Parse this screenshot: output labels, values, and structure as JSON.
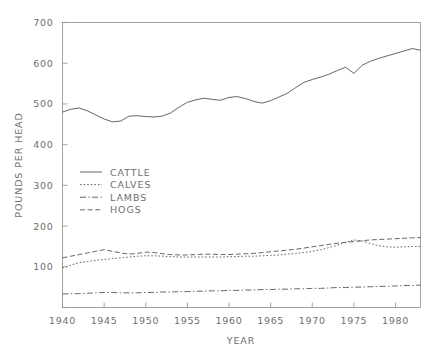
{
  "chart_data": {
    "type": "line",
    "title": "",
    "xlabel": "YEAR",
    "ylabel": "POUNDS PER HEAD",
    "xlim": [
      1940,
      1983
    ],
    "ylim": [
      0,
      700
    ],
    "xticks": [
      1940,
      1945,
      1950,
      1955,
      1960,
      1965,
      1970,
      1975,
      1980
    ],
    "yticks": [
      0,
      100,
      200,
      300,
      400,
      500,
      600,
      700
    ],
    "ytick_labels": [
      "",
      "100",
      "200",
      "300",
      "400",
      "500",
      "600",
      "700"
    ],
    "grid": false,
    "legend_position": "center-left inside axes",
    "x": [
      1940,
      1941,
      1942,
      1943,
      1944,
      1945,
      1946,
      1947,
      1948,
      1949,
      1950,
      1951,
      1952,
      1953,
      1954,
      1955,
      1956,
      1957,
      1958,
      1959,
      1960,
      1961,
      1962,
      1963,
      1964,
      1965,
      1966,
      1967,
      1968,
      1969,
      1970,
      1971,
      1972,
      1973,
      1974,
      1975,
      1976,
      1977,
      1978,
      1979,
      1980,
      1981,
      1982,
      1983
    ],
    "series": [
      {
        "name": "CATTLE",
        "style": "solid",
        "values": [
          480,
          487,
          490,
          483,
          473,
          463,
          456,
          458,
          470,
          471,
          469,
          468,
          470,
          478,
          492,
          504,
          510,
          514,
          511,
          509,
          516,
          518,
          513,
          506,
          502,
          508,
          517,
          526,
          540,
          553,
          560,
          566,
          573,
          582,
          590,
          575,
          595,
          605,
          612,
          618,
          624,
          630,
          636,
          632
        ]
      },
      {
        "name": "CALVES",
        "style": "dotted",
        "values": [
          97,
          104,
          110,
          113,
          116,
          118,
          120,
          122,
          124,
          126,
          127,
          127,
          126,
          125,
          124,
          124,
          124,
          124,
          124,
          124,
          125,
          125,
          126,
          126,
          127,
          128,
          129,
          131,
          133,
          135,
          138,
          142,
          147,
          153,
          160,
          166,
          163,
          157,
          152,
          149,
          148,
          149,
          150,
          150
        ]
      },
      {
        "name": "LAMBS",
        "style": "dashdot",
        "values": [
          33,
          34,
          34,
          35,
          36,
          37,
          37,
          36,
          36,
          36,
          37,
          37,
          38,
          38,
          39,
          39,
          40,
          40,
          41,
          41,
          42,
          42,
          43,
          43,
          44,
          44,
          45,
          45,
          46,
          46,
          47,
          47,
          48,
          49,
          49,
          50,
          50,
          51,
          52,
          52,
          53,
          54,
          54,
          55
        ]
      },
      {
        "name": "HOGS",
        "style": "dashed",
        "values": [
          122,
          126,
          130,
          134,
          138,
          142,
          138,
          134,
          131,
          133,
          136,
          135,
          132,
          130,
          129,
          129,
          130,
          131,
          131,
          130,
          130,
          131,
          132,
          133,
          135,
          137,
          139,
          141,
          143,
          146,
          149,
          152,
          155,
          158,
          160,
          162,
          164,
          166,
          167,
          168,
          169,
          170,
          171,
          172
        ]
      }
    ],
    "legend_entries": [
      {
        "label": "CATTLE",
        "style": "solid"
      },
      {
        "label": "CALVES",
        "style": "dotted"
      },
      {
        "label": "LAMBS",
        "style": "dashdot"
      },
      {
        "label": "HOGS",
        "style": "dashed"
      }
    ]
  },
  "colors": {
    "background": "#ffffff",
    "axis": "#8d8d8d",
    "line": "#555555",
    "text": "#6e6e6e"
  }
}
